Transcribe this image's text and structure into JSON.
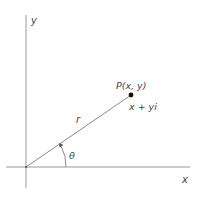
{
  "diagram": {
    "axes": {
      "x_label": "x",
      "y_label": "y"
    },
    "point": {
      "label": "P(x, y)",
      "complex_label": "x + yi"
    },
    "radius_label": "r",
    "angle_label": "θ",
    "colors": {
      "line": "#8a8a8a",
      "text": "#444444",
      "point": "#111111"
    }
  }
}
